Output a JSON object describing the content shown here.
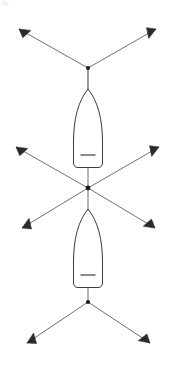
{
  "canvas": {
    "width": 174,
    "height": 373,
    "background": "#ffffff"
  },
  "header": {
    "watermark_text": "fig."
  },
  "style": {
    "line_color": "#4a4a4a",
    "hull_stroke": "#3c3c3c",
    "hull_fill": "#ffffff",
    "node_color": "#1a1a1a",
    "anchor_fill": "#2b2b2b",
    "line_width": 0.8,
    "hull_line_width": 1.0
  },
  "diagram": {
    "type": "mooring-layout",
    "nodes": [
      {
        "id": "node-top",
        "name": "upper-bridle-node",
        "x": 88,
        "y": 68,
        "radius": 2.1
      },
      {
        "id": "node-center",
        "name": "center-crossing-node",
        "x": 88,
        "y": 188,
        "radius": 2.4
      },
      {
        "id": "node-bottom",
        "name": "lower-bridle-node",
        "x": 88,
        "y": 302,
        "radius": 2.1
      }
    ],
    "vessels": [
      {
        "id": "vessel-upper",
        "name": "upper-hull",
        "orientation": "bow-down",
        "bow_x": 88,
        "bow_y": 88,
        "stern_y": 168,
        "beam": 17,
        "thwart": {
          "x1": 81,
          "x2": 95,
          "y": 155
        }
      },
      {
        "id": "vessel-lower",
        "name": "lower-hull",
        "orientation": "bow-up",
        "bow_x": 88,
        "bow_y": 208,
        "stern_y": 288,
        "beam": 17,
        "thwart": {
          "x1": 81,
          "x2": 95,
          "y": 268
        }
      }
    ],
    "tethers": [
      {
        "id": "tether-1",
        "name": "upper-left-rode",
        "from": [
          88,
          68
        ],
        "to": [
          17,
          28
        ],
        "anchor_angle": 209
      },
      {
        "id": "tether-2",
        "name": "upper-right-rode",
        "from": [
          88,
          68
        ],
        "to": [
          158,
          28
        ],
        "anchor_angle": 331
      },
      {
        "id": "tether-3",
        "name": "mid-upper-left-rode",
        "from": [
          88,
          188
        ],
        "to": [
          14,
          146
        ],
        "anchor_angle": 210
      },
      {
        "id": "tether-4",
        "name": "mid-upper-right-rode",
        "from": [
          88,
          188
        ],
        "to": [
          161,
          146
        ],
        "anchor_angle": 330
      },
      {
        "id": "tether-5",
        "name": "mid-lower-left-rode",
        "from": [
          88,
          188
        ],
        "to": [
          20,
          229
        ],
        "anchor_angle": 149
      },
      {
        "id": "tether-6",
        "name": "mid-lower-right-rode",
        "from": [
          88,
          188
        ],
        "to": [
          157,
          229
        ],
        "anchor_angle": 31
      },
      {
        "id": "tether-7",
        "name": "lower-left-rode",
        "from": [
          88,
          302
        ],
        "to": [
          25,
          344
        ],
        "anchor_angle": 146
      },
      {
        "id": "tether-8",
        "name": "lower-right-rode",
        "from": [
          88,
          302
        ],
        "to": [
          152,
          344
        ],
        "anchor_angle": 34
      }
    ],
    "spines": [
      {
        "id": "spine-upper",
        "name": "upper-bow-tether",
        "from": [
          88,
          68
        ],
        "to": [
          88,
          89
        ]
      },
      {
        "id": "spine-upper-stern",
        "name": "upper-stern-tether",
        "from": [
          88,
          168
        ],
        "to": [
          88,
          188
        ]
      },
      {
        "id": "spine-lower-bow",
        "name": "lower-bow-tether",
        "from": [
          88,
          188
        ],
        "to": [
          88,
          208
        ]
      },
      {
        "id": "spine-lower-stern",
        "name": "lower-stern-tether",
        "from": [
          88,
          288
        ],
        "to": [
          88,
          302
        ]
      }
    ],
    "anchor_count": 8,
    "vessel_count": 2,
    "node_count": 3
  }
}
